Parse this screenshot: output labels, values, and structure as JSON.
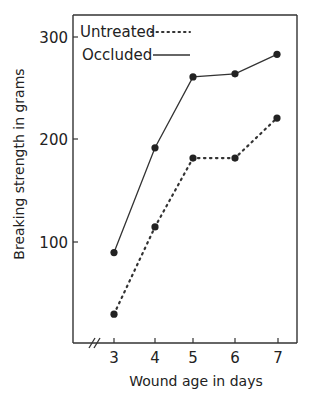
{
  "chart_data": {
    "type": "line",
    "title": "",
    "xlabel": "Wound age in days",
    "ylabel": "Breaking strength in grams",
    "x": [
      3,
      4,
      5,
      6,
      7
    ],
    "x_ticks": [
      "3",
      "4",
      "5",
      "6",
      "7"
    ],
    "y_ticks": [
      "100",
      "200",
      "300"
    ],
    "ylim": [
      0,
      300
    ],
    "xlim": [
      2,
      7.5
    ],
    "x_axis_break": true,
    "grid": false,
    "legend_position": "top-left inside",
    "series": [
      {
        "name": "Untreated",
        "style": "dotted",
        "values": [
          30,
          115,
          182,
          182,
          221
        ]
      },
      {
        "name": "Occluded",
        "style": "solid",
        "values": [
          90,
          192,
          261,
          264,
          283
        ]
      }
    ]
  },
  "legend": {
    "untreated": "Untreated",
    "occluded": "Occluded"
  },
  "axes": {
    "xlabel": "Wound age in days",
    "ylabel": "Breaking strength in grams",
    "yticks": [
      "100",
      "200",
      "300"
    ],
    "xticks": [
      "3",
      "4",
      "5",
      "6",
      "7"
    ]
  },
  "colors": {
    "ink": "#222222",
    "background": "#ffffff"
  }
}
